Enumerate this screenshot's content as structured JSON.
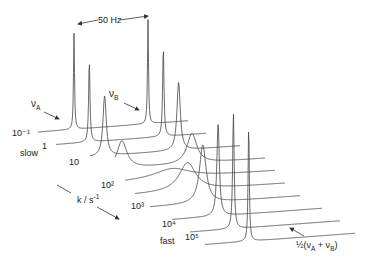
{
  "chart_data": {
    "type": "line",
    "title": "",
    "xlabel": "",
    "ylabel": "",
    "axis_label": "k / s-1",
    "spacing_annotation": "50 Hz",
    "slow_label": "slow",
    "fast_label": "fast",
    "peak_a_label": "νA",
    "peak_b_label": "νB",
    "coalesced_label": "½(νA + νB)",
    "series": [
      {
        "name": "k = 10^-1",
        "label": "10⁻¹",
        "peaks": [
          {
            "pos": 0,
            "height": 96,
            "width": 0.6
          },
          {
            "pos": 74,
            "height": 104,
            "width": 0.6
          }
        ]
      },
      {
        "name": "k = 1",
        "label": "1",
        "peaks": [
          {
            "pos": 0,
            "height": 82,
            "width": 0.8
          },
          {
            "pos": 74,
            "height": 90,
            "width": 0.8
          }
        ]
      },
      {
        "name": "k = 10",
        "label": "10",
        "peaks": [
          {
            "pos": 0,
            "height": 60,
            "width": 2
          },
          {
            "pos": 74,
            "height": 68,
            "width": 2
          }
        ]
      },
      {
        "name": "k = 10^2",
        "label": "10²",
        "peaks": [
          {
            "pos": 2,
            "height": 28,
            "width": 6
          },
          {
            "pos": 72,
            "height": 30,
            "width": 6
          }
        ]
      },
      {
        "name": "k ≈ 3×10^2",
        "label": "",
        "peaks": [
          {
            "pos": 37,
            "height": 10,
            "width": 22
          }
        ]
      },
      {
        "name": "k = 10^3",
        "label": "10³",
        "peaks": [
          {
            "pos": 37,
            "height": 28,
            "width": 10
          }
        ]
      },
      {
        "name": "k ≈ 3×10^3",
        "label": "",
        "peaks": [
          {
            "pos": 37,
            "height": 58,
            "width": 4
          }
        ]
      },
      {
        "name": "k = 10^4",
        "label": "10⁴",
        "peaks": [
          {
            "pos": 37,
            "height": 92,
            "width": 1.5
          }
        ]
      },
      {
        "name": "k ≈ 3×10^4",
        "label": "",
        "peaks": [
          {
            "pos": 37,
            "height": 116,
            "width": 0.9
          }
        ]
      },
      {
        "name": "k = 10^5",
        "label": "10⁵",
        "peaks": [
          {
            "pos": 37,
            "height": 118,
            "width": 0.7
          }
        ]
      }
    ],
    "layout": {
      "origin_x": 40,
      "origin_y": 132,
      "dx": 22,
      "dy": 13,
      "trace_length": 150,
      "peak_a_offset": 34,
      "rise": 8
    }
  }
}
